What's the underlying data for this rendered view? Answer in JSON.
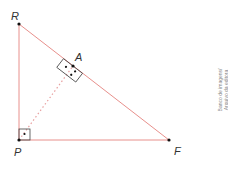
{
  "diagram": {
    "type": "right-triangle-with-altitude",
    "colors": {
      "triangle_line": "#e8908c",
      "altitude_line": "#e8a0a0",
      "marker": "#444444",
      "point": "#111111",
      "label": "#333333",
      "credit": "#888888"
    },
    "vertices": {
      "R": {
        "label": "R",
        "x": 19,
        "y": 24
      },
      "P": {
        "label": "P",
        "x": 19,
        "y": 140
      },
      "F": {
        "label": "F",
        "x": 169,
        "y": 140
      },
      "A": {
        "label": "A",
        "x": 73,
        "y": 66
      }
    },
    "segments": [
      {
        "from": "R",
        "to": "P",
        "style": "solid"
      },
      {
        "from": "P",
        "to": "F",
        "style": "solid"
      },
      {
        "from": "R",
        "to": "F",
        "style": "solid"
      },
      {
        "from": "P",
        "to": "A",
        "style": "dotted"
      }
    ],
    "right_angles": [
      {
        "at": "P",
        "dots": 1
      },
      {
        "at": "A",
        "dots": 3
      }
    ]
  },
  "credit": {
    "line1": "Banco de imagens/",
    "line2": "Arquivo da editora"
  }
}
